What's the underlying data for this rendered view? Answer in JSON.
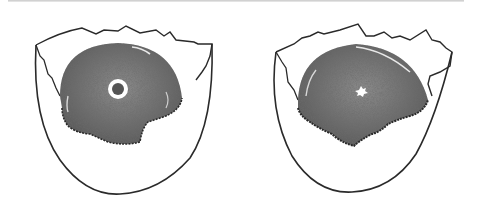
{
  "figure": {
    "panels": [
      {
        "name": "left-egg",
        "germinal_disc": "ring-shaped (blastoderm)"
      },
      {
        "name": "right-egg",
        "germinal_disc": "small irregular spot (blastodisc)"
      }
    ]
  },
  "colors": {
    "outline": "#2a2a2a",
    "yolk": "#6a6a6a",
    "background": "#ffffff"
  }
}
